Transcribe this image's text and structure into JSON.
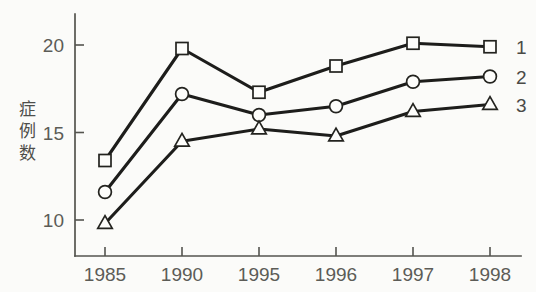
{
  "chart_data": {
    "type": "line",
    "title": "",
    "xlabel": "",
    "ylabel": "症例数",
    "categories": [
      "1985",
      "1990",
      "1995",
      "1996",
      "1997",
      "1998"
    ],
    "x": [
      "1985",
      "1990",
      "1995",
      "1996",
      "1997",
      "1998"
    ],
    "ylim": [
      7.8,
      21.6
    ],
    "yticks": [
      10,
      15,
      20
    ],
    "ytick_labels": [
      "10",
      "15",
      "20"
    ],
    "grid": false,
    "legend_position": "right-of-last-point",
    "series": [
      {
        "name": "1",
        "marker": "square",
        "values": [
          13.4,
          19.8,
          17.3,
          18.8,
          20.1,
          19.9
        ]
      },
      {
        "name": "2",
        "marker": "circle",
        "values": [
          11.6,
          17.2,
          16.0,
          16.5,
          17.9,
          18.2
        ]
      },
      {
        "name": "3",
        "marker": "triangle",
        "values": [
          9.8,
          14.5,
          15.2,
          14.8,
          16.2,
          16.6
        ]
      }
    ],
    "colors": {
      "line": "#1d1d1b",
      "marker_fill": "#fdfdfb",
      "marker_stroke": "#23231f",
      "axis": "#54544f",
      "text": "#5c5c57",
      "background": "#fbfbf9"
    }
  },
  "axis": {
    "y_label_chars": [
      "症",
      "例",
      "数"
    ]
  },
  "legend": {
    "entries": [
      {
        "label": "1"
      },
      {
        "label": "2"
      },
      {
        "label": "3"
      }
    ]
  }
}
